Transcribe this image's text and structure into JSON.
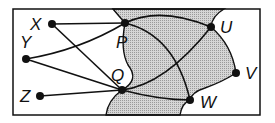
{
  "diagram": {
    "type": "graph",
    "frame": {
      "x": 13,
      "y": 9,
      "width": 247,
      "height": 106
    },
    "colors": {
      "line": "#111111",
      "shade": "#c8c8c8",
      "background": "#ffffff"
    },
    "nodes": [
      {
        "id": "X",
        "label": "X",
        "x": 52,
        "y": 24,
        "lx": 30,
        "ly": 30
      },
      {
        "id": "Y",
        "label": "Y",
        "x": 26,
        "y": 59,
        "lx": 20,
        "ly": 48
      },
      {
        "id": "Z",
        "label": "Z",
        "x": 40,
        "y": 96,
        "lx": 20,
        "ly": 102
      },
      {
        "id": "P",
        "label": "P",
        "x": 125,
        "y": 23,
        "lx": 116,
        "ly": 48
      },
      {
        "id": "Q",
        "label": "Q",
        "x": 122,
        "y": 90,
        "lx": 111,
        "ly": 81
      },
      {
        "id": "U",
        "label": "U",
        "x": 211,
        "y": 27,
        "lx": 220,
        "ly": 33
      },
      {
        "id": "V",
        "label": "V",
        "x": 236,
        "y": 73,
        "lx": 245,
        "ly": 79
      },
      {
        "id": "W",
        "label": "W",
        "x": 190,
        "y": 100,
        "lx": 200,
        "ly": 108
      }
    ],
    "edges": [
      {
        "from": "X",
        "to": "P",
        "path": "M52,24 L125,23"
      },
      {
        "from": "X",
        "to": "Q",
        "path": "M52,24 L122,90"
      },
      {
        "from": "Y",
        "to": "P",
        "path": "M26,59 Q80,50 125,23"
      },
      {
        "from": "Y",
        "to": "Q",
        "path": "M26,59 L122,90"
      },
      {
        "from": "Z",
        "to": "Q",
        "path": "M40,96 L122,90"
      },
      {
        "from": "P",
        "to": "U",
        "path": "M125,23 Q160,6 211,27"
      },
      {
        "from": "P",
        "to": "W",
        "path": "M125,23 Q175,35 190,100"
      },
      {
        "from": "Q",
        "to": "U",
        "path": "M122,90 Q165,85 211,27"
      },
      {
        "from": "Q",
        "to": "W",
        "path": "M122,90 Q160,100 190,100"
      }
    ],
    "shaded_region": "M113,9 L224,9 Q212,16 211,27 Q232,45 236,73 Q222,82 205,88 Q192,92 190,100 Q182,103 180,115 L106,115 Q108,100 122,90 Q140,80 128,65 Q120,50 125,23 Q118,15 113,9 Z"
  }
}
